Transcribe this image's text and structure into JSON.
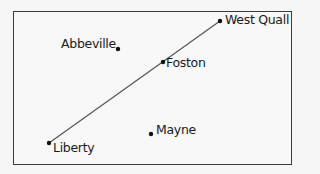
{
  "map": {
    "towns": [
      {
        "name": "Abbeville",
        "x": 118,
        "y": 49,
        "label_x": 61,
        "label_y": 38
      },
      {
        "name": "West Quall",
        "x": 220,
        "y": 21,
        "label_x": 225,
        "label_y": 14
      },
      {
        "name": "Foston",
        "x": 163,
        "y": 62,
        "label_x": 166,
        "label_y": 58
      },
      {
        "name": "Liberty",
        "x": 49,
        "y": 143,
        "label_x": 53,
        "label_y": 142
      },
      {
        "name": "Mayne",
        "x": 151,
        "y": 134,
        "label_x": 156,
        "label_y": 124
      }
    ],
    "road": {
      "from": "Liberty",
      "via": "Foston",
      "to": "West Quall",
      "color": "#555555"
    },
    "colors": {
      "border": "#3a3a3a",
      "dot": "#111111",
      "text": "#1a1a1a",
      "background": "#f8f8f8"
    }
  }
}
